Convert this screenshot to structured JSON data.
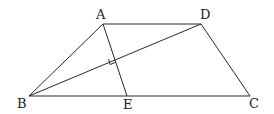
{
  "diagram": {
    "type": "geometry",
    "figure": "trapezoid",
    "points": {
      "A": {
        "label": "A",
        "x": 103,
        "y": 24,
        "lx": 96,
        "ly": 19
      },
      "D": {
        "label": "D",
        "x": 201,
        "y": 24,
        "lx": 200,
        "ly": 19
      },
      "B": {
        "label": "B",
        "x": 29,
        "y": 96,
        "lx": 17,
        "ly": 108
      },
      "E": {
        "label": "E",
        "x": 127,
        "y": 96,
        "lx": 123,
        "ly": 109
      },
      "C": {
        "label": "C",
        "x": 250,
        "y": 96,
        "lx": 249,
        "ly": 108
      }
    },
    "segments": [
      [
        "A",
        "D"
      ],
      [
        "D",
        "C"
      ],
      [
        "B",
        "C"
      ],
      [
        "A",
        "B"
      ],
      [
        "B",
        "D"
      ],
      [
        "A",
        "E"
      ]
    ],
    "right_angle_mark": {
      "at": "intersection of AE and BD",
      "x": 113,
      "y": 61
    }
  }
}
